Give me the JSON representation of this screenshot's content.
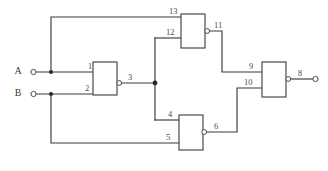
{
  "diagram": {
    "type": "logic-gate-schematic",
    "canvas": {
      "width": 328,
      "height": 171
    },
    "colors": {
      "wire": "#3a3a3a",
      "gate_outline": "#4a4a4a",
      "background": "#ffffff",
      "junction": "#2a2a2a"
    },
    "inputs": [
      {
        "id": "A",
        "label": "A",
        "terminal_x": 33,
        "terminal_y": 72
      },
      {
        "id": "B",
        "label": "B",
        "terminal_x": 33,
        "terminal_y": 94
      }
    ],
    "outputs": [
      {
        "id": "Y",
        "label": "",
        "pin": "8",
        "terminal_x": 316,
        "terminal_y": 79
      }
    ],
    "gates": [
      {
        "id": "gate1",
        "name": "gate-1",
        "kind": "nand",
        "inverted_output": true,
        "box": {
          "x": 93,
          "y": 62,
          "w": 24,
          "h": 33
        },
        "input_pins": [
          "1",
          "2"
        ],
        "output_pin": "3"
      },
      {
        "id": "gate2",
        "name": "gate-2",
        "kind": "nand",
        "inverted_output": true,
        "box": {
          "x": 181,
          "y": 14,
          "w": 24,
          "h": 34
        },
        "input_pins": [
          "13",
          "12"
        ],
        "output_pin": "11"
      },
      {
        "id": "gate3",
        "name": "gate-3",
        "kind": "nand",
        "inverted_output": true,
        "box": {
          "x": 179,
          "y": 115,
          "w": 24,
          "h": 35
        },
        "input_pins": [
          "4",
          "5"
        ],
        "output_pin": "6"
      },
      {
        "id": "gate4",
        "name": "gate-4",
        "kind": "nand",
        "inverted_output": true,
        "box": {
          "x": 262,
          "y": 62,
          "w": 24,
          "h": 35
        },
        "input_pins": [
          "9",
          "10"
        ],
        "output_pin": "8"
      }
    ],
    "pin_labels": {
      "p1": "1",
      "p2": "2",
      "p3": "3",
      "p4": "4",
      "p5": "5",
      "p6": "6",
      "p8": "8",
      "p9": "9",
      "p10": "10",
      "p11": "11",
      "p12": "12",
      "p13": "13"
    },
    "nets": [
      {
        "name": "A-fanout",
        "from": "A",
        "to": [
          "pin 1",
          "pin 13"
        ]
      },
      {
        "name": "B-fanout",
        "from": "B",
        "to": [
          "pin 2",
          "pin 5"
        ]
      },
      {
        "name": "node-3",
        "from": "gate1 out 3",
        "to": [
          "pin 12",
          "pin 4"
        ]
      },
      {
        "name": "node-11",
        "from": "gate2 out 11",
        "to": [
          "pin 9"
        ]
      },
      {
        "name": "node-6",
        "from": "gate3 out 6",
        "to": [
          "pin 10"
        ]
      },
      {
        "name": "node-8",
        "from": "gate4 out 8",
        "to": [
          "output terminal"
        ]
      }
    ],
    "junctions": [
      {
        "x": 51,
        "y": 72
      },
      {
        "x": 51,
        "y": 94
      },
      {
        "x": 155,
        "y": 83
      }
    ]
  }
}
